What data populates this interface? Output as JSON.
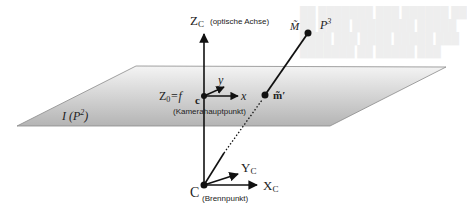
{
  "diagram": {
    "colors": {
      "background": "#ffffff",
      "plane_fill_top": "#f4f4f4",
      "plane_fill_bottom": "#b4b4b4",
      "plane_edge": "#8a8a8a",
      "lines": "#111111"
    },
    "labels": {
      "zc_axis": "Z",
      "zc_sub": "C",
      "zc_note": "(optische Achse)",
      "image_plane": "I (",
      "image_plane_p": "P",
      "image_plane_sup": "2",
      "image_plane_close": ")",
      "z0": "Z",
      "z0_sub": "0",
      "z0_eq": "=f",
      "principal_point": "c",
      "principal_point_note": "(Kamerahauptpunkt)",
      "x_axis": "x",
      "y_axis": "y",
      "image_point": "m̃′",
      "world_point": "M̃",
      "world_space": "P",
      "world_space_sup": "3",
      "camera_center": "C",
      "camera_center_note": "(Brennpunkt)",
      "xc_axis": "X",
      "xc_sub": "C",
      "yc_axis": "Y",
      "yc_sub": "C"
    },
    "nodes": [
      {
        "id": "C",
        "name": "Brennpunkt",
        "x": 204,
        "y": 185
      },
      {
        "id": "c",
        "name": "Kamerahauptpunkt",
        "x": 204,
        "y": 96
      },
      {
        "id": "m",
        "name": "Bildpunkt",
        "x": 265,
        "y": 95
      },
      {
        "id": "M",
        "name": "Weltpunkt",
        "x": 308,
        "y": 33
      }
    ],
    "edges": [
      {
        "from": "C",
        "to": "Zc-arrow",
        "label": "optische Achse"
      },
      {
        "from": "C",
        "to": "Xc-arrow"
      },
      {
        "from": "C",
        "to": "Yc-arrow"
      },
      {
        "from": "C",
        "to": "m",
        "style": "dotted"
      },
      {
        "from": "m",
        "to": "M"
      },
      {
        "from": "c",
        "to": "x-arrow"
      },
      {
        "from": "c",
        "to": "y-arrow"
      }
    ]
  }
}
